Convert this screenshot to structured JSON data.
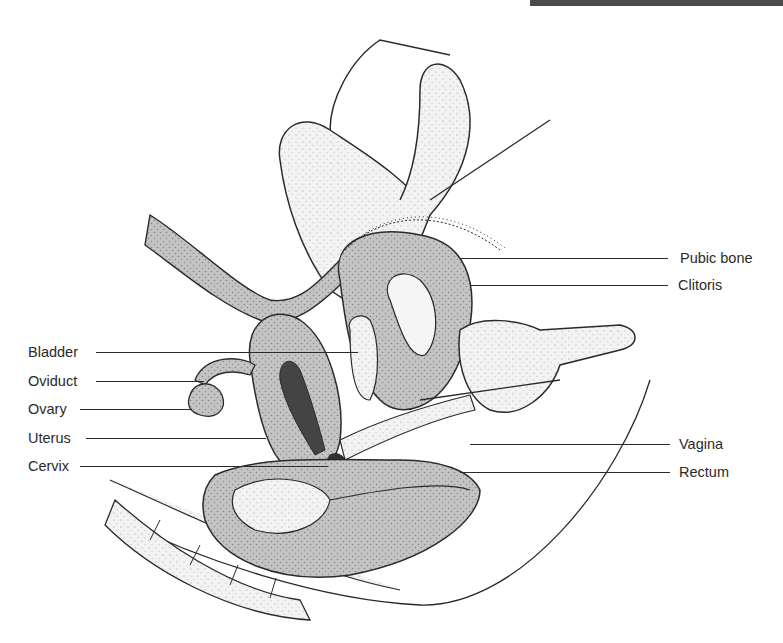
{
  "figure": {
    "header_fragment": "",
    "labels_left": [
      {
        "id": "bladder",
        "text": "Bladder"
      },
      {
        "id": "oviduct",
        "text": "Oviduct"
      },
      {
        "id": "ovary",
        "text": "Ovary"
      },
      {
        "id": "uterus",
        "text": "Uterus"
      },
      {
        "id": "cervix",
        "text": "Cervix"
      }
    ],
    "labels_right": [
      {
        "id": "pubic-bone",
        "text": "Pubic bone"
      },
      {
        "id": "clitoris",
        "text": "Clitoris"
      },
      {
        "id": "vagina",
        "text": "Vagina"
      },
      {
        "id": "rectum",
        "text": "Rectum"
      }
    ]
  },
  "colors": {
    "ink": "#2a2a2a",
    "tissue": "#bdbdbd",
    "tissue_light": "#e2e2e2",
    "cavity": "#555555",
    "background": "#ffffff"
  }
}
